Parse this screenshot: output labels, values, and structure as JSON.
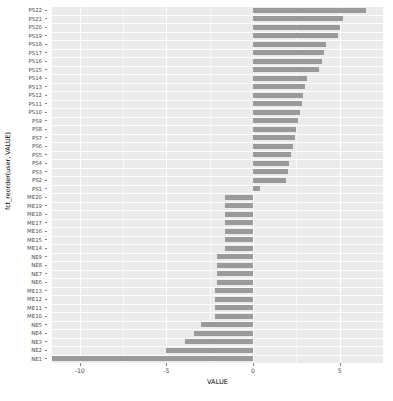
{
  "chart_data": {
    "type": "bar",
    "orientation": "horizontal",
    "title": "",
    "xlabel": "VALUE",
    "ylabel": "fct_reorder(user, VALUE)",
    "xlim": [
      -11.6,
      7.5
    ],
    "xticks": [
      -10,
      -5,
      0,
      5
    ],
    "xtick_labels": [
      "-10",
      "-5",
      "0",
      "5"
    ],
    "grid": true,
    "legend": "none",
    "bar_color": "#9a9a9a",
    "panel_color": "#ebebeb",
    "grid_color": "#ffffff",
    "categories": [
      "PS22",
      "PS21",
      "PS20",
      "PS19",
      "PS18",
      "PS17",
      "PS16",
      "PS15",
      "PS14",
      "PS13",
      "PS12",
      "PS11",
      "PS10",
      "PS9",
      "PS8",
      "PS7",
      "PS6",
      "PS5",
      "PS4",
      "PS3",
      "PS2",
      "PS1",
      "ME20",
      "ME19",
      "ME18",
      "ME17",
      "ME16",
      "ME15",
      "ME14",
      "NE9",
      "NE8",
      "NE7",
      "NE6",
      "ME13",
      "ME12",
      "ME11",
      "ME10",
      "NE5",
      "NE4",
      "NE3",
      "NE2",
      "NE1"
    ],
    "values": [
      6.5,
      5.2,
      5.0,
      4.9,
      4.2,
      4.1,
      4.0,
      3.8,
      3.1,
      3.0,
      2.9,
      2.8,
      2.7,
      2.6,
      2.5,
      2.4,
      2.3,
      2.2,
      2.1,
      2.0,
      1.9,
      0.4,
      -1.6,
      -1.6,
      -1.6,
      -1.6,
      -1.6,
      -1.6,
      -1.6,
      -2.1,
      -2.1,
      -2.1,
      -2.1,
      -2.2,
      -2.2,
      -2.2,
      -2.2,
      -3.0,
      -3.4,
      -3.9,
      -5.0,
      -11.6
    ]
  },
  "axes": {
    "x_title": "VALUE",
    "y_title": "fct_reorder(user, VALUE)"
  }
}
